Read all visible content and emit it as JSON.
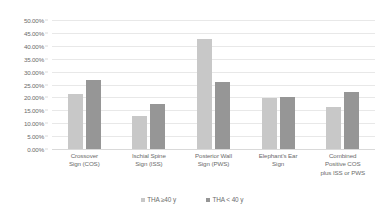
{
  "chart_data": {
    "type": "bar",
    "title": "",
    "subtitle": "",
    "xlabel": "",
    "ylabel": "",
    "ylim": [
      0,
      50
    ],
    "grid": true,
    "legend_position": "bottom",
    "value_format": "percent",
    "categories": [
      [
        "Crossover",
        "Sign (COS)"
      ],
      [
        "Ischial Spine",
        "Sign (ISS)"
      ],
      [
        "Posterior Wall",
        "Sign (PWS)"
      ],
      [
        "Elephant's Ear",
        "Sign"
      ],
      [
        "Combined",
        "Positive COS",
        "plus ISS or PWS"
      ]
    ],
    "category_labels": [
      "Crossover Sign (COS)",
      "Ischial Spine Sign (ISS)",
      "Posterior Wall Sign (PWS)",
      "Elephant's Ear Sign",
      "Combined Positive COS plus ISS or PWS"
    ],
    "series": [
      {
        "name": "THA ≥40 y",
        "color": "#c8c8c8",
        "values": [
          21.5,
          12.7,
          42.8,
          19.7,
          16.2
        ]
      },
      {
        "name": "THA < 40 y",
        "color": "#969696",
        "values": [
          26.7,
          17.6,
          25.9,
          20.3,
          22.0
        ]
      }
    ],
    "y_ticks": [
      "0.00%",
      "5.00%",
      "10.00%",
      "15.00%",
      "20.00%",
      "25.00%",
      "30.00%",
      "35.00%",
      "40.00%",
      "45.00%",
      "50.00%"
    ],
    "y_tick_values": [
      0,
      5,
      10,
      15,
      20,
      25,
      30,
      35,
      40,
      45,
      50
    ]
  },
  "legend": {
    "items": [
      {
        "label": "THA ≥40 y",
        "color": "#c8c8c8"
      },
      {
        "label": "THA < 40 y",
        "color": "#969696"
      }
    ]
  }
}
